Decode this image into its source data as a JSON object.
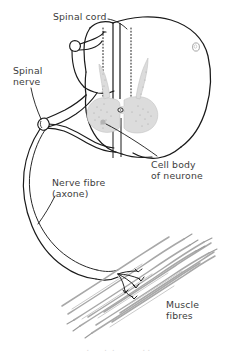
{
  "figure": {
    "background_color": "#ffffff",
    "ink_color": "#1a1a1a",
    "grey_matter_color": "#d9d9d9",
    "muscle_color": "#b0b0b0",
    "label_color": "#3c3c3c"
  },
  "labels": {
    "spinal_cord": "Spinal cord",
    "spinal_nerve": "Spinal\nnerve",
    "nerve_fibre": "Nerve fibre\n(axone)",
    "cell_body": "Cell body\nof neurone",
    "muscle_fibres": "Muscle\nfibres"
  },
  "parts": {
    "cord_outline": "spinal-cord-outline",
    "grey_matter": "grey-matter-butterfly",
    "central_canal": "central-canal",
    "dorsal_median_fissure": "dorsal-median-fissure",
    "cut_stub": "cord-cut-stub",
    "nerve_root": "spinal-nerve-root",
    "axon": "motor-axon",
    "end_plates": "motor-end-plates",
    "muscle_bundle": "muscle-fibre-bundle"
  },
  "bottom_partial_text": "   .      .  .           . ."
}
